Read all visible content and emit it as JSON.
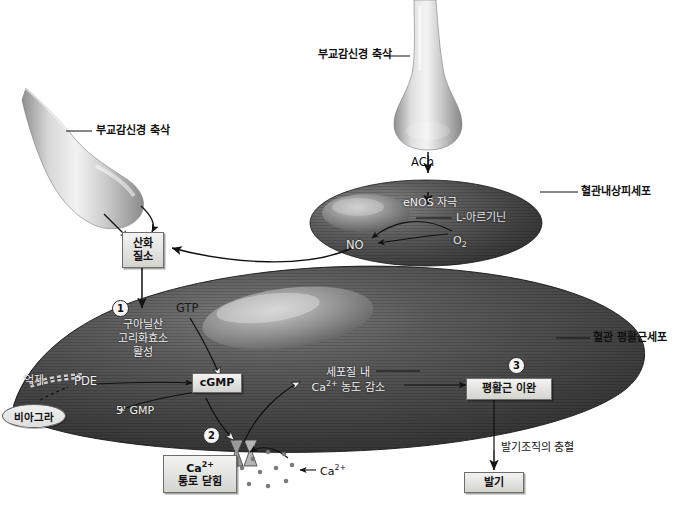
{
  "diagram": {
    "background_color": "#ffffff"
  },
  "neurons": {
    "left_axon_label": "부교감신경 축삭",
    "right_axon_label": "부교감신경 축삭"
  },
  "neurotransmitter": {
    "ach": "ACh"
  },
  "endothelial_cell": {
    "label": "혈관내상피세포",
    "enos": "eNOS 자극",
    "substrate": "L-아르기닌",
    "oxygen": "O2",
    "product": "NO"
  },
  "nitric_oxide_box": {
    "line1": "산화",
    "line2": "질소"
  },
  "smooth_muscle_cell": {
    "label": "혈관 평활근세포"
  },
  "steps": {
    "one": {
      "number": "1",
      "line1": "구아닐산",
      "line2": "고리화효소",
      "line3": "활성"
    },
    "two": {
      "number": "2"
    },
    "three": {
      "number": "3",
      "label": "평활근 이완"
    }
  },
  "molecules": {
    "gtp": "GTP",
    "cgmp": "cGMP",
    "pde": "PDE",
    "gmp5": "5' GMP",
    "calcium": "Ca2+"
  },
  "viagra": {
    "drug_label": "비아그라",
    "action_label": "억제"
  },
  "calcium_channel_box": {
    "line1": "Ca2+",
    "line2": "통로 닫힘"
  },
  "cytosol_calcium": {
    "line1": "세포질 내",
    "line2": "Ca2+ 농도 감소"
  },
  "outcome": {
    "engorgement": "발기조직의 충혈",
    "erection": "발기"
  },
  "colors": {
    "line": "#1a1a1a",
    "box_fill": "#e4e4e1",
    "cell_dark": "#4a4a4a",
    "background": "#ffffff"
  }
}
